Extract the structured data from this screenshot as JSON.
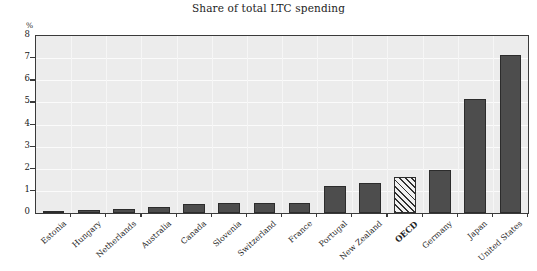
{
  "chart_data": {
    "type": "bar",
    "title": "Share of total LTC spending",
    "xlabel": "",
    "ylabel": "%",
    "ylim": [
      0,
      8
    ],
    "yticks": [
      0,
      1,
      2,
      3,
      4,
      5,
      6,
      7,
      8
    ],
    "ytick_labels": [
      "0",
      "1",
      "2",
      "3",
      "4",
      "5",
      "6",
      "7",
      "8"
    ],
    "grid": true,
    "legend": null,
    "categories": [
      "Estonia",
      "Hungary",
      "Netherlands",
      "Australia",
      "Canada",
      "Slovenia",
      "Switzerland",
      "France",
      "Portugal",
      "New Zealand",
      "OECD",
      "Germany",
      "Japan",
      "United States"
    ],
    "values": [
      0.08,
      0.12,
      0.2,
      0.27,
      0.43,
      0.45,
      0.46,
      0.46,
      1.2,
      1.35,
      1.65,
      1.95,
      5.15,
      7.15
    ],
    "highlight_index": 10,
    "highlight_style": "hatched",
    "bar_color": "#4d4d4d",
    "bar_edge_color": "#2c2c2c",
    "highlight_fill": "#f0f0f0",
    "plot_background": "#ececec",
    "grid_color": "#fbfbfb",
    "axis_color": "#3a3a3a",
    "text_color": "#1f1f1f"
  }
}
